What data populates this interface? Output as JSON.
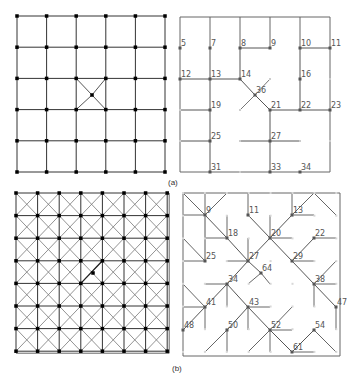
{
  "figure": {
    "panel_a": {
      "caption": "(a)",
      "left": {
        "description": "6x6 square grid with a center node connected diagonally",
        "cols": 6,
        "rows": 6,
        "x0": 17,
        "y0": 16,
        "dx": 29.6,
        "dy": 31.2,
        "center_node": {
          "x": 92,
          "y": 95
        }
      },
      "right": {
        "nodes": [
          {
            "id": "5",
            "x": 180,
            "y": 48
          },
          {
            "id": "7",
            "x": 210,
            "y": 48
          },
          {
            "id": "8",
            "x": 240,
            "y": 48
          },
          {
            "id": "9",
            "x": 270,
            "y": 48
          },
          {
            "id": "10",
            "x": 300,
            "y": 48
          },
          {
            "id": "11",
            "x": 330,
            "y": 48
          },
          {
            "id": "12",
            "x": 180,
            "y": 79
          },
          {
            "id": "13",
            "x": 210,
            "y": 79
          },
          {
            "id": "14",
            "x": 240,
            "y": 79
          },
          {
            "id": "16",
            "x": 300,
            "y": 79
          },
          {
            "id": "36",
            "x": 255,
            "y": 95
          },
          {
            "id": "19",
            "x": 210,
            "y": 110
          },
          {
            "id": "21",
            "x": 270,
            "y": 110
          },
          {
            "id": "22",
            "x": 300,
            "y": 110
          },
          {
            "id": "23",
            "x": 330,
            "y": 110
          },
          {
            "id": "25",
            "x": 210,
            "y": 141
          },
          {
            "id": "27",
            "x": 270,
            "y": 141
          },
          {
            "id": "31",
            "x": 210,
            "y": 172
          },
          {
            "id": "33",
            "x": 270,
            "y": 172
          },
          {
            "id": "34",
            "x": 300,
            "y": 172
          }
        ]
      }
    },
    "panel_b": {
      "caption": "(b)",
      "left": {
        "description": "8x8 grid with diagonal cross connections in every cell",
        "cols": 8,
        "rows": 8,
        "x0": 16,
        "y0": 193,
        "dx": 21.6,
        "dy": 22.6,
        "center_node": {
          "x": 93,
          "y": 273
        }
      },
      "right": {
        "nodes": [
          {
            "id": "9",
            "x": 205,
            "y": 215
          },
          {
            "id": "11",
            "x": 248,
            "y": 215
          },
          {
            "id": "13",
            "x": 292,
            "y": 215
          },
          {
            "id": "18",
            "x": 227,
            "y": 238
          },
          {
            "id": "20",
            "x": 270,
            "y": 238
          },
          {
            "id": "22",
            "x": 314,
            "y": 238
          },
          {
            "id": "25",
            "x": 205,
            "y": 261
          },
          {
            "id": "27",
            "x": 248,
            "y": 261
          },
          {
            "id": "29",
            "x": 292,
            "y": 261
          },
          {
            "id": "64",
            "x": 261,
            "y": 273
          },
          {
            "id": "34",
            "x": 227,
            "y": 284
          },
          {
            "id": "38",
            "x": 314,
            "y": 284
          },
          {
            "id": "41",
            "x": 205,
            "y": 307
          },
          {
            "id": "43",
            "x": 248,
            "y": 307
          },
          {
            "id": "47",
            "x": 336,
            "y": 307
          },
          {
            "id": "48",
            "x": 183,
            "y": 330
          },
          {
            "id": "50",
            "x": 227,
            "y": 330
          },
          {
            "id": "52",
            "x": 270,
            "y": 330
          },
          {
            "id": "54",
            "x": 314,
            "y": 330
          },
          {
            "id": "61",
            "x": 292,
            "y": 352
          }
        ]
      }
    }
  }
}
